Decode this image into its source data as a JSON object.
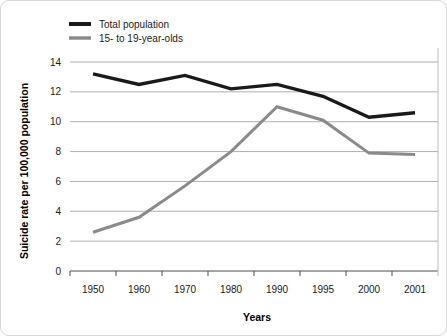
{
  "chart_data": {
    "type": "line",
    "title": "",
    "xlabel": "Years",
    "ylabel": "Suicide rate per 100,000 population",
    "categories": [
      "1950",
      "1960",
      "1970",
      "1980",
      "1990",
      "1995",
      "2000",
      "2001"
    ],
    "ylim": [
      0,
      14
    ],
    "yticks": [
      0,
      2,
      4,
      6,
      8,
      10,
      12,
      14
    ],
    "ytick_labels": [
      "0",
      "2",
      "4",
      "6",
      "8",
      "10",
      "12",
      "14"
    ],
    "grid": true,
    "grid_axis": "y",
    "legend_position": "top-left",
    "series": [
      {
        "name": "Total population",
        "color": "#1a1a1a",
        "values": [
          13.2,
          12.5,
          13.1,
          12.2,
          12.5,
          11.7,
          10.3,
          10.6
        ]
      },
      {
        "name": "15- to 19-year-olds",
        "color": "#8a8a8a",
        "values": [
          2.6,
          3.6,
          5.7,
          8.0,
          11.0,
          10.1,
          7.9,
          7.8
        ]
      }
    ]
  },
  "colors": {
    "background": "#ffffff",
    "frame": "#d8d8d8",
    "gridline": "#8c8c8c",
    "axis": "#4d4d4d",
    "total_population": "#1a1a1a",
    "teens": "#8a8a8a"
  }
}
